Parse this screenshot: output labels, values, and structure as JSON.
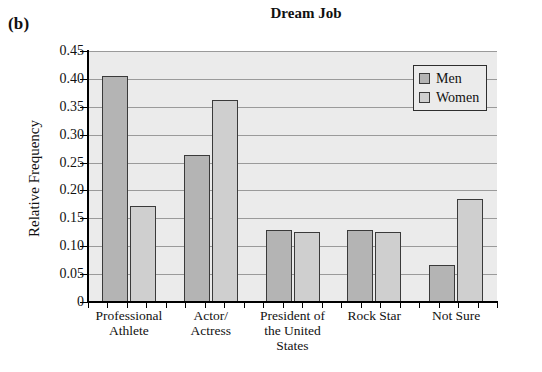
{
  "figure": {
    "panel_label": "(b)",
    "title": "Dream Job"
  },
  "chart_data": {
    "type": "bar",
    "title": "Dream Job",
    "xlabel": "",
    "ylabel": "Relative Frequency",
    "ylim": [
      0,
      0.45
    ],
    "yticks": [
      "0",
      "0.05",
      "0.10",
      "0.15",
      "0.20",
      "0.25",
      "0.30",
      "0.35",
      "0.40",
      "0.45"
    ],
    "ytick_values": [
      0,
      0.05,
      0.1,
      0.15,
      0.2,
      0.25,
      0.3,
      0.35,
      0.4,
      0.45
    ],
    "grid": true,
    "legend_position": "top-right",
    "categories": [
      "Professional Athlete",
      "Actor/ Actress",
      "President of the United States",
      "Rock Star",
      "Not Sure"
    ],
    "category_lines": [
      [
        "Professional",
        "Athlete"
      ],
      [
        "Actor/",
        "Actress"
      ],
      [
        "President of",
        "the United",
        "States"
      ],
      [
        "Rock Star"
      ],
      [
        "Not Sure"
      ]
    ],
    "series": [
      {
        "name": "Men",
        "color": "#b4b4b4",
        "values": [
          0.405,
          0.263,
          0.129,
          0.129,
          0.066
        ]
      },
      {
        "name": "Women",
        "color": "#cfcfcf",
        "values": [
          0.173,
          0.363,
          0.125,
          0.125,
          0.185
        ]
      }
    ]
  },
  "legend": {
    "items": [
      {
        "label": "Men",
        "swatch": "men"
      },
      {
        "label": "Women",
        "swatch": "women"
      }
    ]
  },
  "colors": {
    "plot_background": "#ebebeb",
    "gridline": "#9a9a9a",
    "axis": "#000000",
    "bar_men": "#b4b4b4",
    "bar_women": "#cfcfcf",
    "bar_border": "#3a3a3a"
  }
}
